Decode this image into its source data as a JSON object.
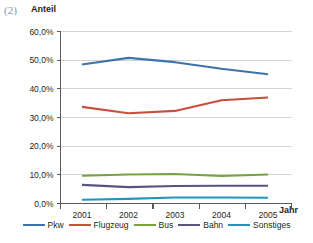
{
  "figure": {
    "number_label": "(2)",
    "y_axis_title": "Anteil",
    "x_axis_title": "Jahr"
  },
  "chart_data": {
    "type": "line",
    "title": "",
    "xlabel": "Jahr",
    "ylabel": "Anteil",
    "categories": [
      "2001",
      "2002",
      "2003",
      "2004",
      "2005"
    ],
    "x_tick_labels": [
      "2001",
      "2002",
      "2003",
      "2004",
      "2005"
    ],
    "y_tick_labels": [
      "60,0%",
      "50,0%",
      "40,0%",
      "30,0%",
      "20,0%",
      "10,0%",
      "0,0%"
    ],
    "y_tick_values": [
      60,
      50,
      40,
      30,
      20,
      10,
      0
    ],
    "ylim": [
      0,
      60
    ],
    "grid": "horizontal",
    "legend_position": "bottom",
    "series": [
      {
        "name": "Pkw",
        "color": "#3e72ab",
        "values": [
          48.5,
          50.8,
          49.3,
          47.0,
          45.1
        ]
      },
      {
        "name": "Flugzeug",
        "color": "#c74f3c",
        "values": [
          33.7,
          31.5,
          32.3,
          36.0,
          37.0
        ]
      },
      {
        "name": "Bus",
        "color": "#76a33f",
        "values": [
          9.7,
          10.1,
          10.3,
          9.6,
          10.1
        ]
      },
      {
        "name": "Bahn",
        "color": "#55557e",
        "values": [
          6.5,
          5.7,
          6.1,
          6.2,
          6.2
        ]
      },
      {
        "name": "Sonstiges",
        "color": "#2196bd",
        "values": [
          1.3,
          1.6,
          2.1,
          2.1,
          2.0
        ]
      }
    ]
  },
  "legend": {
    "items": [
      {
        "label": "Pkw",
        "color": "#3e72ab"
      },
      {
        "label": "Flugzeug",
        "color": "#c74f3c"
      },
      {
        "label": "Bus",
        "color": "#76a33f"
      },
      {
        "label": "Bahn",
        "color": "#55557e"
      },
      {
        "label": "Sonstiges",
        "color": "#2196bd"
      }
    ]
  }
}
